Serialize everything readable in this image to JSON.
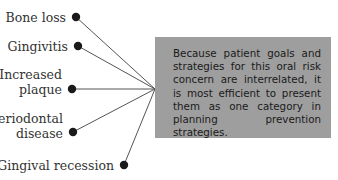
{
  "diagram": {
    "items": [
      {
        "label_lines": [
          "Bone loss"
        ],
        "dot": [
          76,
          17
        ]
      },
      {
        "label_lines": [
          "Gingivitis"
        ],
        "dot": [
          78,
          46
        ]
      },
      {
        "label_lines": [
          "Increased",
          "plaque"
        ],
        "dot": [
          72,
          89
        ]
      },
      {
        "label_lines": [
          "Periodontal",
          "disease"
        ],
        "dot": [
          73,
          132
        ]
      },
      {
        "label_lines": [
          "Gingival recession"
        ],
        "dot": [
          124,
          165
        ]
      }
    ],
    "hub": [
      155,
      89
    ],
    "box_text": "Because patient goals and strategies for this oral risk concern are interrelated, it is most efficient to present them as one category in plan­ning prevention strategies.",
    "colors": {
      "box_fill": "#9e9e9e",
      "line": "#555555",
      "dot": "#1a1a1a",
      "text": "#333333"
    }
  }
}
